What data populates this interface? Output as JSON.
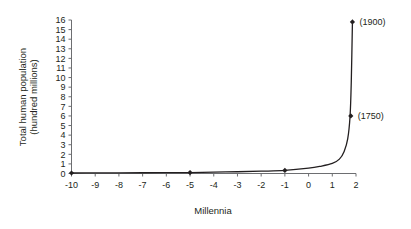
{
  "chart_data": {
    "type": "line",
    "title": "",
    "xlabel": "Millennia",
    "ylabel": "Total human population (hundred millions)",
    "ylabel_line1": "Total human population",
    "ylabel_line2": "(hundred millions)",
    "xlim": [
      -10,
      2
    ],
    "ylim": [
      0,
      16
    ],
    "grid": false,
    "legend": "none",
    "xticks": [
      -10,
      -9,
      -8,
      -7,
      -6,
      -5,
      -4,
      -3,
      -2,
      -1,
      0,
      1,
      2
    ],
    "xtick_labels": [
      "-10",
      "-9",
      "-8",
      "-7",
      "-6",
      "-5",
      "-4",
      "-3",
      "-2",
      "-1",
      "0",
      "1",
      "2"
    ],
    "yticks": [
      0,
      1,
      2,
      3,
      4,
      5,
      6,
      7,
      8,
      9,
      10,
      11,
      12,
      13,
      14,
      15,
      16
    ],
    "ytick_labels": [
      "0",
      "1",
      "2",
      "3",
      "4",
      "5",
      "6",
      "7",
      "8",
      "9",
      "10",
      "11",
      "12",
      "13",
      "14",
      "15",
      "16"
    ],
    "x": [
      -10,
      -9,
      -8,
      -7,
      -6,
      -5,
      -4,
      -3,
      -2,
      -1,
      0,
      0.5,
      1,
      1.3,
      1.5,
      1.65,
      1.75,
      1.8,
      1.85
    ],
    "y": [
      0.05,
      0.06,
      0.07,
      0.08,
      0.09,
      0.1,
      0.14,
      0.18,
      0.24,
      0.32,
      0.55,
      0.75,
      1.05,
      1.5,
      2.3,
      3.6,
      6.0,
      9.5,
      15.8
    ],
    "series": [
      {
        "name": "Total human population",
        "x": [
          -10,
          -9,
          -8,
          -7,
          -6,
          -5,
          -4,
          -3,
          -2,
          -1,
          0,
          0.5,
          1,
          1.3,
          1.5,
          1.65,
          1.75,
          1.8,
          1.85
        ],
        "values": [
          0.05,
          0.06,
          0.07,
          0.08,
          0.09,
          0.1,
          0.14,
          0.18,
          0.24,
          0.32,
          0.55,
          0.75,
          1.05,
          1.5,
          2.3,
          3.6,
          6.0,
          9.5,
          15.8
        ]
      }
    ],
    "markers": [
      {
        "x": -10,
        "y": 0.05,
        "label": ""
      },
      {
        "x": -5,
        "y": 0.1,
        "label": ""
      },
      {
        "x": -1,
        "y": 0.32,
        "label": ""
      },
      {
        "x": 1.78,
        "y": 6.0,
        "label": "(1750)"
      },
      {
        "x": 1.85,
        "y": 15.8,
        "label": "(1900)"
      }
    ],
    "annotations": [
      {
        "text": "(1900)",
        "x": 1.85,
        "y": 15.8
      },
      {
        "text": "(1750)",
        "x": 1.78,
        "y": 6.0
      }
    ],
    "colors": {
      "curve": "#231f20",
      "marker": "#231f20",
      "axis": "#6d6e71",
      "text": "#231f20",
      "background": "#ffffff"
    }
  }
}
